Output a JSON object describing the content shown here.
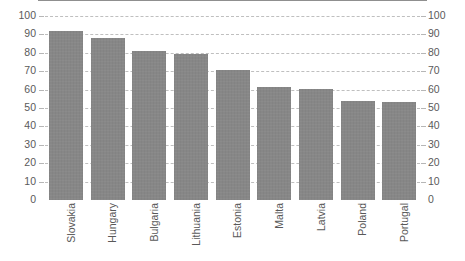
{
  "chart_data": {
    "type": "bar",
    "title": "",
    "subtitle": "",
    "xlabel": "",
    "ylabel": "",
    "categories": [
      "Slovakia",
      "Hungary",
      "Bulgaria",
      "Lithuania",
      "Estonia",
      "Malta",
      "Latvia",
      "Poland",
      "Portugal"
    ],
    "values": [
      92,
      88,
      81,
      79.5,
      70.5,
      61.5,
      60.5,
      54,
      53.5
    ],
    "series": [
      {
        "name": "",
        "values": [
          92,
          88,
          81,
          79.5,
          70.5,
          61.5,
          60.5,
          54,
          53.5
        ]
      }
    ],
    "ylim": [
      0,
      100
    ],
    "ytick_step": 10,
    "left_axis_ticks": [
      "100",
      "90",
      "80",
      "70",
      "60",
      "50",
      "40",
      "30",
      "20",
      "10",
      "0"
    ],
    "right_axis_ticks": [
      "100",
      "90",
      "80",
      "70",
      "60",
      "50",
      "40",
      "30",
      "20",
      "10",
      "0"
    ],
    "grid": true,
    "grid_style": "dashed",
    "grid_axis": "y",
    "legend": null,
    "legend_position": "none",
    "annotations": [],
    "colors": {
      "bar_fill": "#878787",
      "gridline": "#bfbfbf",
      "axis_line": "#8f8f8f",
      "tick_label": "#5a5a5a",
      "category_label": "#595959",
      "background": "#ffffff"
    }
  }
}
